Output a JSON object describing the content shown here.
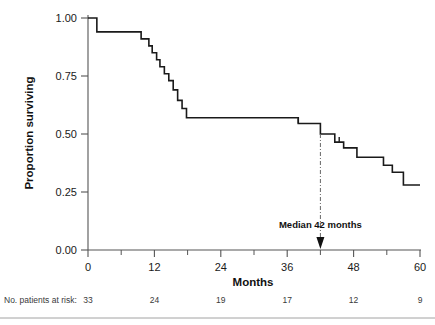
{
  "chart_data": {
    "type": "line",
    "title": "",
    "xlabel": "Months",
    "ylabel": "Proportion surviving",
    "xlim": [
      0,
      60
    ],
    "ylim": [
      0,
      1.0
    ],
    "grid": false,
    "legend": "none",
    "x_ticks": [
      0,
      12,
      24,
      36,
      48,
      60
    ],
    "x_tick_labels": [
      "0",
      "12",
      "24",
      "36",
      "48",
      "60"
    ],
    "x_minor_ticks": [
      6,
      18,
      30,
      42,
      54
    ],
    "y_ticks": [
      0.0,
      0.25,
      0.5,
      0.75,
      1.0
    ],
    "y_tick_labels": [
      "0.00",
      "0.25",
      "0.50",
      "0.75",
      "1.00"
    ],
    "series": [
      {
        "name": "Survival",
        "step": "post",
        "x": [
          0,
          1.0,
          1.6,
          8.0,
          9.6,
          11.0,
          11.6,
          12.4,
          13.0,
          13.8,
          14.6,
          15.4,
          16.2,
          17.0,
          17.8,
          36.8,
          38.0,
          42.0,
          43.4,
          44.6,
          46.2,
          48.6,
          51.0,
          53.4,
          55.0,
          57.0,
          60.0
        ],
        "y": [
          1.0,
          1.0,
          0.94,
          0.94,
          0.91,
          0.88,
          0.85,
          0.82,
          0.79,
          0.76,
          0.73,
          0.69,
          0.645,
          0.61,
          0.57,
          0.57,
          0.545,
          0.5,
          0.5,
          0.465,
          0.44,
          0.4,
          0.4,
          0.365,
          0.335,
          0.28,
          0.28
        ]
      }
    ],
    "censor_marks": [
      {
        "x": 38.0,
        "y": 0.545
      },
      {
        "x": 45.4,
        "y": 0.465
      }
    ],
    "annotations": [
      {
        "name": "median-annotation",
        "text": "Median 42 months",
        "x": 42,
        "y": 0.5,
        "line_style": "dash-dot",
        "arrow": "down"
      }
    ]
  },
  "axes": {
    "y_label": "Proportion surviving",
    "x_label": "Months",
    "y_tick_labels": [
      "1.00",
      "0.75",
      "0.50",
      "0.25",
      "0.00"
    ],
    "x_tick_labels": [
      "0",
      "12",
      "24",
      "36",
      "48",
      "60"
    ]
  },
  "annotation": {
    "median_text": "Median 42 months"
  },
  "risk_table": {
    "label": "No. patients at risk:",
    "values": [
      "33",
      "24",
      "19",
      "17",
      "12",
      "9"
    ]
  },
  "colors": {
    "curve": "#1a1a1a",
    "axis": "#555555",
    "annotation": "#111111",
    "risk": "#3a3a3a",
    "background": "#ffffff"
  }
}
